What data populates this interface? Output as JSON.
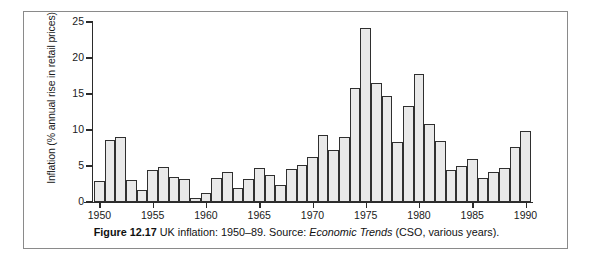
{
  "figure": {
    "caption_number": "Figure 12.17",
    "caption_text": " UK inflation: 1950–89. Source: ",
    "caption_source_italic": "Economic Trends",
    "caption_tail": " (CSO, various years)."
  },
  "chart_data": {
    "type": "bar",
    "title": "",
    "xlabel": "",
    "ylabel": "Inflation (% annual rise in retail prices)",
    "ylim": [
      0,
      25
    ],
    "xlim": [
      1949.3,
      1990.7
    ],
    "grid": false,
    "legend": null,
    "ytick_labels": [
      "0",
      "5",
      "10",
      "15",
      "20",
      "25"
    ],
    "ytick_values": [
      0,
      5,
      10,
      15,
      20,
      25
    ],
    "xtick_labels": [
      "1950",
      "1955",
      "1960",
      "1965",
      "1970",
      "1975",
      "1980",
      "1985",
      "1990"
    ],
    "xtick_values": [
      1950,
      1955,
      1960,
      1965,
      1970,
      1975,
      1980,
      1985,
      1990
    ],
    "categories": [
      1950,
      1951,
      1952,
      1953,
      1954,
      1955,
      1956,
      1957,
      1958,
      1959,
      1960,
      1961,
      1962,
      1963,
      1964,
      1965,
      1966,
      1967,
      1968,
      1969,
      1970,
      1971,
      1972,
      1973,
      1974,
      1975,
      1976,
      1977,
      1978,
      1979,
      1980,
      1981,
      1982,
      1983,
      1984,
      1985,
      1986,
      1987,
      1988,
      1989,
      1990
    ],
    "values": [
      2.9,
      8.6,
      9.0,
      3.1,
      1.7,
      4.4,
      4.9,
      3.5,
      3.2,
      0.5,
      1.2,
      3.3,
      4.2,
      2.0,
      3.2,
      4.7,
      3.8,
      2.3,
      4.6,
      5.2,
      6.2,
      9.3,
      7.2,
      9.0,
      15.9,
      24.2,
      16.5,
      14.7,
      8.3,
      13.4,
      17.8,
      10.8,
      8.5,
      4.5,
      5.0,
      6.0,
      3.3,
      4.1,
      4.7,
      7.7,
      9.9
    ],
    "bar_fill_color": "#e9e9e9",
    "bar_edge_color": "#2f2f2f",
    "axis_color": "#2b2b2b"
  }
}
